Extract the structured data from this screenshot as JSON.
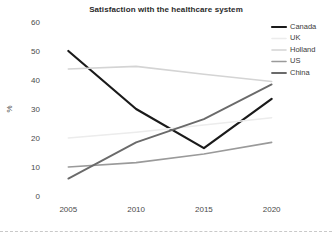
{
  "chart_data": {
    "type": "line",
    "title": "Satisfaction with the healthcare system",
    "xlabel": "",
    "ylabel": "%",
    "categories": [
      "2005",
      "2010",
      "2015",
      "2020"
    ],
    "x": [
      2005,
      2010,
      2015,
      2020
    ],
    "xlim": [
      2003.5,
      2021.5
    ],
    "ylim": [
      0,
      60
    ],
    "yticks": [
      "0",
      "10",
      "20",
      "30",
      "40",
      "50",
      "60"
    ],
    "ytick_values": [
      0,
      10,
      20,
      30,
      40,
      50,
      60
    ],
    "grid": false,
    "legend_position": "top-right",
    "series": [
      {
        "name": "Canada",
        "color": "#1a1a1a",
        "width": 2.2,
        "values": [
          50,
          30,
          16.5,
          33.5
        ]
      },
      {
        "name": "UK",
        "color": "#ececec",
        "width": 1.6,
        "values": [
          20,
          22,
          24.5,
          27
        ]
      },
      {
        "name": "Holland",
        "color": "#d4d4d4",
        "width": 1.6,
        "values": [
          43.8,
          44.7,
          42,
          39.5
        ]
      },
      {
        "name": "US",
        "color": "#9a9a9a",
        "width": 1.6,
        "values": [
          10,
          11.5,
          14.5,
          18.5
        ]
      },
      {
        "name": "China",
        "color": "#6a6a6a",
        "width": 1.8,
        "values": [
          6,
          18.5,
          26.5,
          38.5
        ]
      }
    ]
  },
  "legend": {
    "items": [
      {
        "label": "Canada"
      },
      {
        "label": "UK"
      },
      {
        "label": "Holland"
      },
      {
        "label": "US"
      },
      {
        "label": "China"
      }
    ]
  }
}
